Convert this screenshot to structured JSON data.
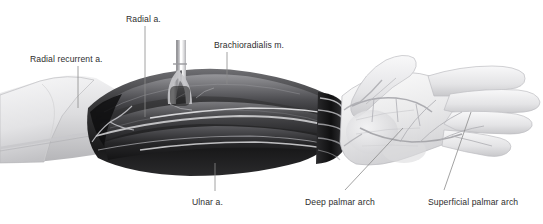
{
  "figure": {
    "background_color": "#ffffff",
    "label_color": "#2e2e2e",
    "width": 543,
    "height": 224
  },
  "labels": [
    {
      "id": "radial-recurrent",
      "text": "Radial recurrent a.",
      "x": 30,
      "y": 55,
      "leader": {
        "x1": 78,
        "y1": 66,
        "x2": 78,
        "y2": 108
      }
    },
    {
      "id": "radial",
      "text": "Radial a.",
      "x": 126,
      "y": 15,
      "leader": {
        "x1": 145,
        "y1": 26,
        "x2": 145,
        "y2": 117
      }
    },
    {
      "id": "brachioradialis",
      "text": "Brachioradialis m.",
      "x": 214,
      "y": 41,
      "leader": {
        "x1": 227,
        "y1": 52,
        "x2": 227,
        "y2": 84
      }
    },
    {
      "id": "ulnar",
      "text": "Ulnar a.",
      "x": 192,
      "y": 198,
      "leader": {
        "x1": 215,
        "y1": 163,
        "x2": 215,
        "y2": 191
      }
    },
    {
      "id": "deep-palmar-arch",
      "text": "Deep palmar arch",
      "x": 305,
      "y": 198,
      "leader": {
        "x1": 403,
        "y1": 128,
        "x2": 345,
        "y2": 190
      }
    },
    {
      "id": "superficial-palmar-arch",
      "text": "Superficial palmar arch",
      "x": 428,
      "y": 198,
      "leader": {
        "x1": 471,
        "y1": 112,
        "x2": 444,
        "y2": 190
      }
    }
  ],
  "palette": {
    "skin_light": "#e9e9ea",
    "skin_mid": "#cfcfd1",
    "skin_shadow": "#a9a9ac",
    "muscle_dark": "#1b1b1c",
    "muscle_mid": "#3c3c3e",
    "muscle_light": "#6a6a6d",
    "vessel_light": "#d8d8da",
    "leader_line": "#8a8a8a",
    "outline": "#8e8e91"
  },
  "regions": [
    {
      "id": "upper-arm",
      "name": "upper arm skin flap"
    },
    {
      "id": "forearm-muscles",
      "name": "dissected forearm musculature"
    },
    {
      "id": "retractor",
      "name": "vessel cannula / retractor at elbow"
    },
    {
      "id": "wrist-tendons",
      "name": "wrist flexor tendons"
    },
    {
      "id": "hand",
      "name": "open palm with palmar arterial arches"
    }
  ]
}
